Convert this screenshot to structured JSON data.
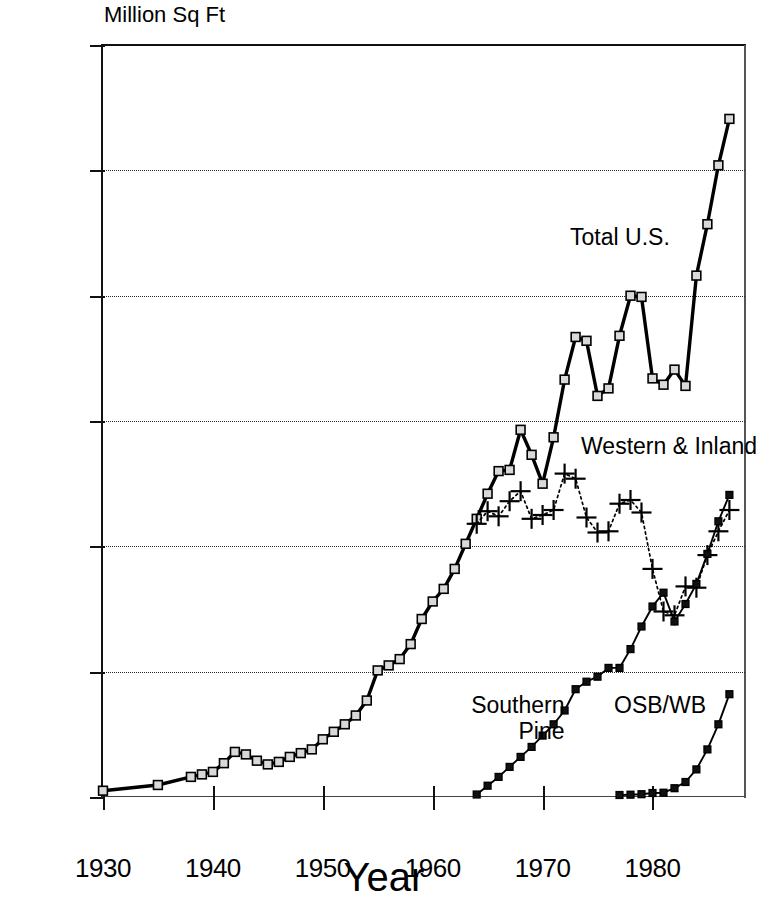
{
  "chart_data": {
    "type": "line",
    "title": "",
    "xlabel": "Year",
    "ylabel": "Million Sq Ft",
    "xlim": [
      1930,
      1988.6
    ],
    "ylim": [
      0,
      30000
    ],
    "xticks": [
      1930,
      1940,
      1950,
      1960,
      1970,
      1980
    ],
    "yticks": [
      0,
      5000,
      10000,
      15000,
      20000,
      25000,
      30000
    ],
    "grid": "horizontal-dotted",
    "legend_position": "inline-annotations",
    "series": [
      {
        "name": "Total U.S.",
        "marker": "square",
        "linestyle": "solid",
        "x": [
          1930,
          1935,
          1938,
          1939,
          1940,
          1941,
          1942,
          1943,
          1944,
          1945,
          1946,
          1947,
          1948,
          1949,
          1950,
          1951,
          1952,
          1953,
          1954,
          1955,
          1956,
          1957,
          1958,
          1959,
          1960,
          1961,
          1962,
          1963,
          1964,
          1965,
          1966,
          1967,
          1968,
          1969,
          1970,
          1971,
          1972,
          1973,
          1974,
          1975,
          1976,
          1977,
          1978,
          1979,
          1980,
          1981,
          1982,
          1983,
          1984,
          1985,
          1986,
          1987
        ],
        "values": [
          250,
          480,
          800,
          900,
          1000,
          1350,
          1800,
          1700,
          1450,
          1300,
          1400,
          1600,
          1750,
          1900,
          2300,
          2600,
          2900,
          3250,
          3850,
          5050,
          5250,
          5500,
          6100,
          7100,
          7800,
          8300,
          9100,
          10100,
          11100,
          12100,
          13000,
          13050,
          14650,
          13650,
          12500,
          14350,
          16650,
          18350,
          18200,
          16000,
          16300,
          18400,
          20000,
          19950,
          16700,
          16450,
          17050,
          16400,
          20800,
          22850,
          25200,
          27050
        ]
      },
      {
        "name": "Western & Inland",
        "marker": "plus",
        "linestyle": "dotted",
        "x": [
          1964,
          1965,
          1966,
          1967,
          1968,
          1969,
          1970,
          1971,
          1972,
          1973,
          1974,
          1975,
          1976,
          1977,
          1978,
          1979,
          1980,
          1981,
          1982,
          1983,
          1984,
          1985,
          1986,
          1987
        ],
        "values": [
          10900,
          11400,
          11200,
          11800,
          12200,
          11100,
          11250,
          11450,
          12900,
          12700,
          11150,
          10550,
          10600,
          11700,
          11850,
          11350,
          9100,
          7400,
          7250,
          8400,
          8350,
          9650,
          10600,
          11450
        ]
      },
      {
        "name": "Southern Pine",
        "marker": "square",
        "linestyle": "solid-thin",
        "x": [
          1964,
          1965,
          1966,
          1967,
          1968,
          1969,
          1970,
          1971,
          1972,
          1973,
          1974,
          1975,
          1976,
          1977,
          1978,
          1979,
          1980,
          1981,
          1982,
          1983,
          1984,
          1985,
          1986,
          1987
        ],
        "values": [
          100,
          450,
          800,
          1200,
          1600,
          2000,
          2450,
          2900,
          3450,
          4300,
          4600,
          4800,
          5150,
          5150,
          5900,
          6800,
          7600,
          8150,
          7000,
          7700,
          8500,
          9700,
          11000,
          12050
        ]
      },
      {
        "name": "OSB/WB",
        "marker": "square",
        "linestyle": "solid-thin",
        "x": [
          1977,
          1978,
          1979,
          1980,
          1981,
          1982,
          1983,
          1984,
          1985,
          1986,
          1987
        ],
        "values": [
          80,
          90,
          110,
          160,
          170,
          350,
          600,
          1100,
          1900,
          2900,
          4100
        ]
      }
    ],
    "annotations": [
      {
        "text": "Total U.S.",
        "x": 1972.5,
        "y": 22800
      },
      {
        "text": "Western & Inland",
        "x": 1973.5,
        "y": 14500
      },
      {
        "text": "Southern\nPine",
        "x": 1963.5,
        "y": 4150
      },
      {
        "text": "OSB/WB",
        "x": 1976.5,
        "y": 4150
      }
    ]
  },
  "axis": {
    "y_label": "Million Sq Ft",
    "x_label": "Year",
    "y_ticks": [
      "30000",
      "25000",
      "20000",
      "15000",
      "10000",
      "5000",
      "0"
    ],
    "x_ticks": [
      "1930",
      "1940",
      "1950",
      "1960",
      "1970",
      "1980"
    ]
  },
  "labels": {
    "total_us": "Total U.S.",
    "western_inland": "Western & Inland",
    "southern_pine_line1": "Southern",
    "southern_pine_line2": "Pine",
    "osb_wb": "OSB/WB"
  },
  "colors": {
    "ink": "#000000",
    "grid": "#2b2b2b",
    "marker_fill": "#d9d9d9",
    "background": "#ffffff"
  }
}
